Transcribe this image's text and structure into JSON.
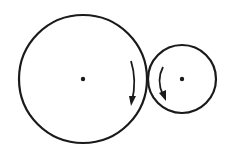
{
  "diagram": {
    "stroke_color": "#1a1a1a",
    "background": "#ffffff",
    "large_wheel": {
      "cx": 83,
      "cy": 79,
      "r": 64,
      "rotation": "clockwise"
    },
    "small_wheel": {
      "cx": 182,
      "cy": 79,
      "r": 34,
      "rotation": "counterclockwise"
    }
  }
}
